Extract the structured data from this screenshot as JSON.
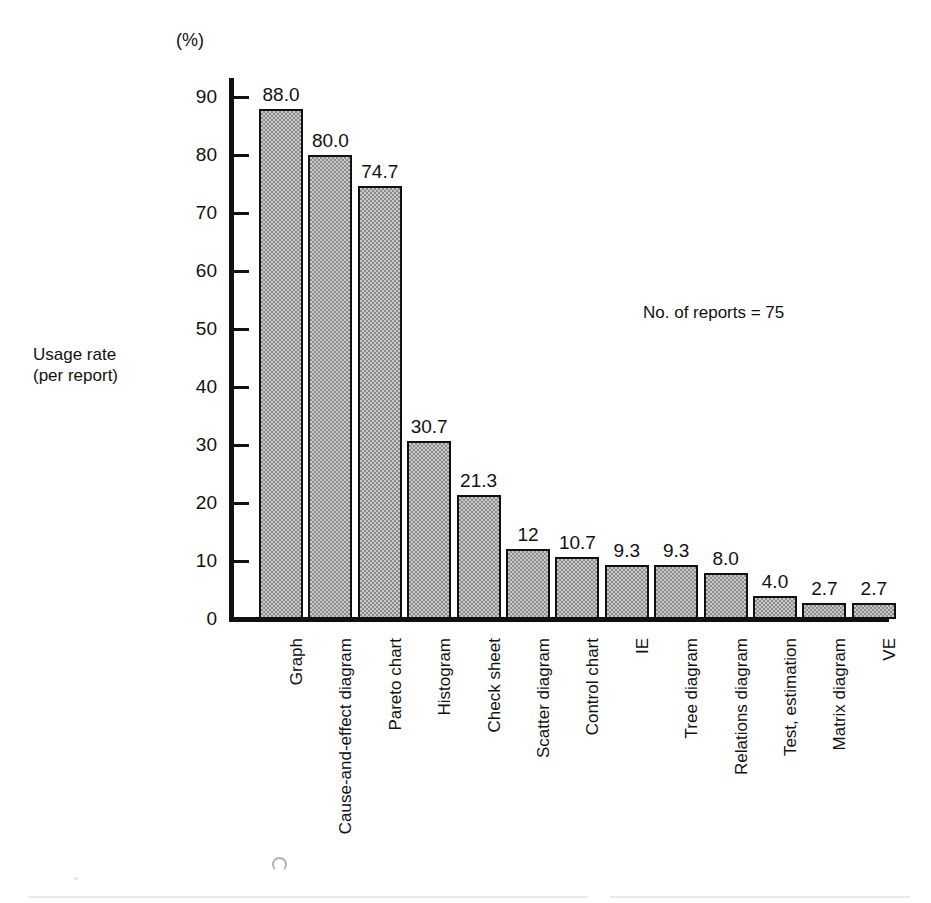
{
  "chart_data": {
    "type": "bar",
    "title": "",
    "subtitle": "",
    "unit_label": "(%)",
    "ylabel": "Usage rate\n(per report)",
    "ylabel_line1": "Usage rate",
    "ylabel_line2": "(per report)",
    "xlabel": "",
    "annotation": "No. of reports = 75",
    "ylim": [
      0,
      95
    ],
    "ytick_step": 10,
    "grid": false,
    "legend": null,
    "yticks": [
      90,
      80,
      70,
      60,
      50,
      40,
      30,
      20,
      10,
      0
    ],
    "ytick_labels": [
      "90",
      "80",
      "70",
      "60",
      "50",
      "40",
      "30",
      "20",
      "10",
      "0"
    ],
    "categories": [
      "Graph",
      "Cause-and-effect diagram",
      "Pareto chart",
      "Histogram",
      "Check sheet",
      "Scatter diagram",
      "Control chart",
      "IE",
      "Tree diagram",
      "Relations diagram",
      "Test, estimation",
      "Matrix diagram",
      "VE"
    ],
    "values": [
      88.0,
      80.0,
      74.7,
      30.7,
      21.3,
      12,
      10.7,
      9.3,
      9.3,
      8.0,
      4.0,
      2.7,
      2.7
    ],
    "value_labels": [
      "88.0",
      "80.0",
      "74.7",
      "30.7",
      "21.3",
      "12",
      "10.7",
      "9.3",
      "9.3",
      "8.0",
      "4.0",
      "2.7",
      "2.7"
    ],
    "bar_fill_color": "#c9c9c9",
    "bar_edge_color": "#111111",
    "axis_color": "#111111",
    "background_color": "#ffffff"
  }
}
